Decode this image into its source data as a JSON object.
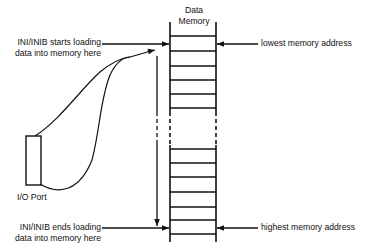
{
  "diagram": {
    "memory_title_line1": "Data",
    "memory_title_line2": "Memory",
    "start_label_line1": "INI/INIB starts loading",
    "start_label_line2": "data into memory here",
    "end_label_line1": "INI/INIB ends loading",
    "end_label_line2": "data into memory here",
    "lowest_label": "lowest memory address",
    "highest_label": "highest memory address",
    "io_port_label": "I/O Port",
    "line_color": "#111111"
  }
}
